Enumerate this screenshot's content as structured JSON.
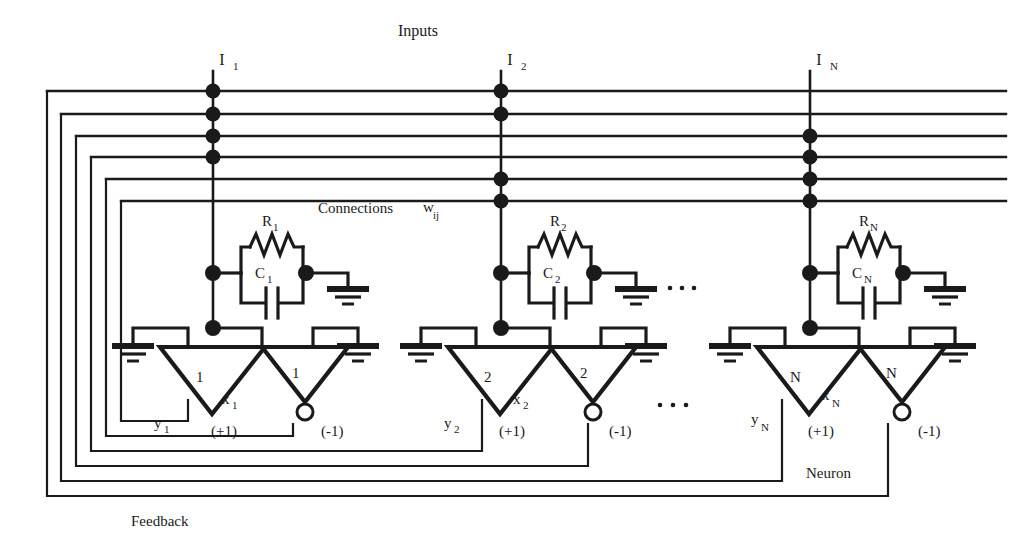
{
  "figure": {
    "title_label": "Inputs",
    "connections_label": "Connections",
    "weight_label": "w",
    "weight_sub": "ij",
    "neuron_label": "Neuron",
    "feedback_label": "Feedback",
    "ellipsis": "· · ·",
    "line_color": "#1a1a1a",
    "background": "#ffffff"
  },
  "inputs": [
    {
      "name": "I",
      "sub": "1"
    },
    {
      "name": "I",
      "sub": "2"
    },
    {
      "name": "I",
      "sub": "N"
    }
  ],
  "columns": [
    {
      "index": "1",
      "resistor": {
        "name": "R",
        "sub": "1"
      },
      "capacitor": {
        "name": "C",
        "sub": "1"
      },
      "amp_pos": {
        "gain": "1",
        "sign": "(+1)"
      },
      "amp_neg": {
        "gain": "1",
        "sign": "(-1)"
      },
      "state": {
        "name": "x",
        "sub": "1"
      },
      "output": {
        "name": "y",
        "sub": "1"
      }
    },
    {
      "index": "2",
      "resistor": {
        "name": "R",
        "sub": "2"
      },
      "capacitor": {
        "name": "C",
        "sub": "2"
      },
      "amp_pos": {
        "gain": "2",
        "sign": "(+1)"
      },
      "amp_neg": {
        "gain": "2",
        "sign": "(-1)"
      },
      "state": {
        "name": "x",
        "sub": "2"
      },
      "output": {
        "name": "y",
        "sub": "2"
      }
    },
    {
      "index": "N",
      "resistor": {
        "name": "R",
        "sub": "N"
      },
      "capacitor": {
        "name": "C",
        "sub": "N"
      },
      "amp_pos": {
        "gain": "N",
        "sign": "(+1)"
      },
      "amp_neg": {
        "gain": "N",
        "sign": "(-1)"
      },
      "state": {
        "name": "x",
        "sub": "N"
      },
      "output": {
        "name": "y",
        "sub": "N"
      }
    }
  ],
  "bus": {
    "count": 6,
    "description": "six horizontal feedback bus lines crossed by three input columns",
    "junctions": {
      "column_1": [
        1,
        2,
        3,
        4
      ],
      "column_2": [
        1,
        2,
        5,
        6
      ],
      "column_N": [
        3,
        4,
        5,
        6
      ]
    }
  }
}
